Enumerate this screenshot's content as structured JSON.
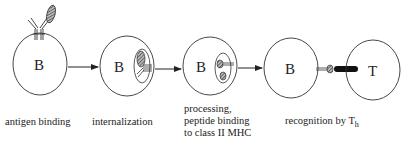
{
  "diagram": {
    "stages": [
      {
        "cell_label": "B",
        "caption_lines": [
          "antigen binding"
        ]
      },
      {
        "cell_label": "B",
        "caption_lines": [
          "internalization"
        ]
      },
      {
        "cell_label": "B",
        "caption_lines": [
          "processing,",
          "peptide binding",
          "to class II MHC"
        ]
      },
      {
        "cell_label": "B",
        "caption_lines": [
          "recognition by T"
        ],
        "caption_subscript": "h"
      }
    ],
    "partner_cell_label": "T",
    "colors": {
      "stroke": "#333333",
      "antigen_fill": "#777777",
      "tcr_fill": "#111111"
    }
  }
}
